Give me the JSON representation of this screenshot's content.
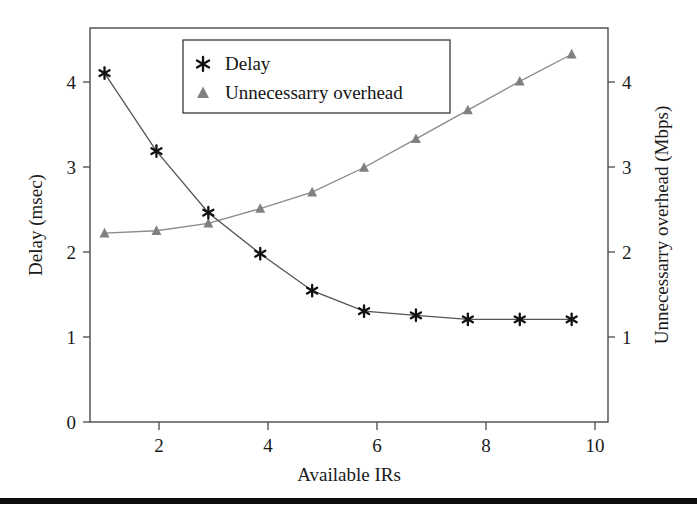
{
  "figure": {
    "background_color": "#ffffff",
    "has_bottom_rule": true,
    "bottom_rule_color": "#0d0d0d"
  },
  "legend": {
    "position": "top-center-left",
    "entries": [
      {
        "label": "Delay",
        "marker": "asterisk-icon",
        "color": "#111111"
      },
      {
        "label": "Unnecessarry overhead",
        "marker": "triangle-icon",
        "color": "#808080"
      }
    ]
  },
  "axes": {
    "x": {
      "label": "Available IRs",
      "ticks": [
        "2",
        "4",
        "6",
        "8",
        "10"
      ],
      "tick_values": [
        2,
        4,
        6,
        8,
        10
      ],
      "range": [
        0.72,
        10.7
      ]
    },
    "y_left": {
      "label": "Delay (msec)",
      "ticks": [
        "0",
        "1",
        "2",
        "3",
        "4"
      ],
      "tick_values": [
        0,
        1,
        2,
        3,
        4
      ],
      "range": [
        -0.25,
        4.55
      ]
    },
    "y_right": {
      "label": "Unnecessarry overhead (Mbps)",
      "ticks": [
        "1",
        "2",
        "3",
        "4"
      ],
      "tick_values": [
        1,
        2,
        3,
        4
      ],
      "range": [
        -0.25,
        4.55
      ]
    }
  },
  "chart_data": {
    "type": "line",
    "title": "",
    "xlabel": "Available IRs",
    "ylabel": "Delay (msec)",
    "ylabel_right": "Unnecessarry overhead (Mbps)",
    "x": [
      1,
      2,
      3,
      4,
      5,
      6,
      7,
      8,
      9,
      10
    ],
    "xlim": [
      0.72,
      10.7
    ],
    "ylim": [
      -0.25,
      4.55
    ],
    "ylim_right": [
      -0.25,
      4.55
    ],
    "grid": false,
    "legend_position": "upper left inside",
    "series": [
      {
        "name": "Delay",
        "axis": "left",
        "marker": "asterisk",
        "color": "#111111",
        "line_color": "#555555",
        "values": [
          4.0,
          3.05,
          2.3,
          1.8,
          1.35,
          1.1,
          1.05,
          1.0,
          1.0,
          1.0
        ]
      },
      {
        "name": "Unnecessarry overhead",
        "axis": "right",
        "marker": "triangle",
        "color": "#808080",
        "line_color": "#8a8a8a",
        "values": [
          2.05,
          2.08,
          2.17,
          2.35,
          2.55,
          2.85,
          3.2,
          3.55,
          3.9,
          4.23
        ]
      }
    ]
  }
}
